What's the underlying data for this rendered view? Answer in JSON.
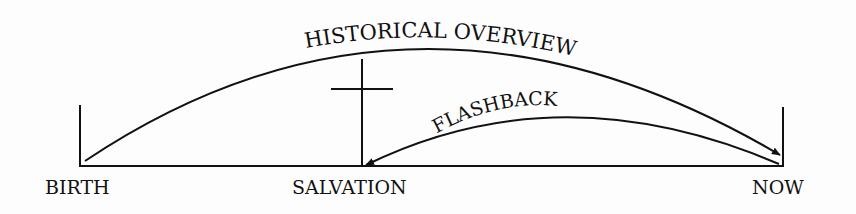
{
  "diagram": {
    "labels": {
      "birth": "BIRTH",
      "salvation": "SALVATION",
      "now": "NOW",
      "historical": "HISTORICAL OVERVIEW",
      "flashback": "FLASHBACK"
    },
    "colors": {
      "ink": "#111111",
      "background": "#fdfdfd"
    }
  }
}
